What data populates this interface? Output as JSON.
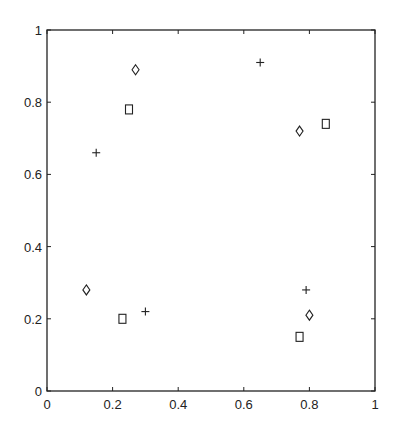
{
  "chart_data": {
    "type": "scatter",
    "title": "",
    "xlabel": "",
    "ylabel": "",
    "xlim": [
      0,
      1
    ],
    "ylim": [
      0,
      1
    ],
    "grid": false,
    "legend": null,
    "x_ticks": [
      0,
      0.2,
      0.4,
      0.6,
      0.8,
      1
    ],
    "x_tick_labels": [
      "0",
      "0.2",
      "0.4",
      "0.6",
      "0.8",
      "1"
    ],
    "y_ticks": [
      0,
      0.2,
      0.4,
      0.6,
      0.8,
      1
    ],
    "y_tick_labels": [
      "0",
      "0.2",
      "0.4",
      "0.6",
      "0.8",
      "1"
    ],
    "series": [
      {
        "name": "plus",
        "marker": "plus",
        "color": "#222222",
        "points": [
          {
            "x": 0.15,
            "y": 0.66
          },
          {
            "x": 0.3,
            "y": 0.22
          },
          {
            "x": 0.65,
            "y": 0.91
          },
          {
            "x": 0.79,
            "y": 0.28
          }
        ]
      },
      {
        "name": "diamond",
        "marker": "diamond",
        "color": "#222222",
        "points": [
          {
            "x": 0.27,
            "y": 0.89
          },
          {
            "x": 0.12,
            "y": 0.28
          },
          {
            "x": 0.77,
            "y": 0.72
          },
          {
            "x": 0.8,
            "y": 0.21
          }
        ]
      },
      {
        "name": "square",
        "marker": "square",
        "color": "#222222",
        "points": [
          {
            "x": 0.25,
            "y": 0.78
          },
          {
            "x": 0.23,
            "y": 0.2
          },
          {
            "x": 0.85,
            "y": 0.74
          },
          {
            "x": 0.77,
            "y": 0.15
          }
        ]
      }
    ]
  }
}
